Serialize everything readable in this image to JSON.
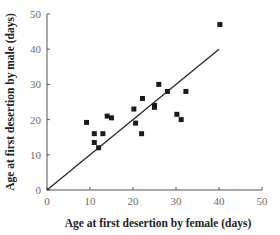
{
  "chart_data": {
    "type": "scatter",
    "title": "",
    "xlabel": "Age at first desertion by female (days)",
    "ylabel": "Age at first desertion by male (days)",
    "xlim": [
      0,
      50
    ],
    "ylim": [
      0,
      50
    ],
    "xticks": [
      0,
      10,
      20,
      30,
      40,
      50
    ],
    "yticks": [
      0,
      10,
      20,
      30,
      40,
      50
    ],
    "grid": false,
    "legend": null,
    "series": [
      {
        "name": "observations",
        "marker": "square",
        "color": "#1a1a1a",
        "points": [
          [
            9.2,
            19.2
          ],
          [
            11.0,
            16.0
          ],
          [
            11.0,
            13.5
          ],
          [
            12.0,
            12.0
          ],
          [
            13.0,
            16.0
          ],
          [
            14.0,
            21.0
          ],
          [
            15.0,
            20.5
          ],
          [
            20.2,
            23.0
          ],
          [
            20.6,
            19.0
          ],
          [
            22.0,
            16.0
          ],
          [
            22.2,
            26.0
          ],
          [
            25.0,
            24.0
          ],
          [
            25.0,
            23.5
          ],
          [
            26.0,
            30.0
          ],
          [
            28.0,
            28.0
          ],
          [
            30.2,
            21.5
          ],
          [
            31.2,
            20.0
          ],
          [
            32.3,
            28.0
          ],
          [
            40.2,
            47.0
          ]
        ]
      }
    ],
    "reference_line": {
      "label": "y = x",
      "from": [
        0,
        0
      ],
      "to": [
        40,
        40
      ],
      "color": "#222222"
    }
  }
}
